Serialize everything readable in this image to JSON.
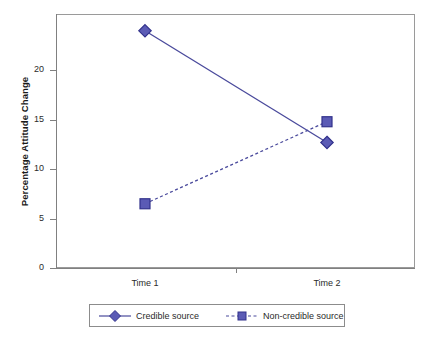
{
  "chart_data": {
    "type": "line",
    "title": "",
    "xlabel": "",
    "ylabel": "Percentage Attitude Change",
    "categories": [
      "Time 1",
      "Time 2"
    ],
    "series": [
      {
        "name": "Credible source",
        "values": [
          24.0,
          12.7
        ],
        "marker": "diamond",
        "linestyle": "solid",
        "color": "#4a4a9c"
      },
      {
        "name": "Non-credible source",
        "values": [
          6.5,
          14.8
        ],
        "marker": "square",
        "linestyle": "dashed",
        "color": "#4a4a9c"
      }
    ],
    "ylim": [
      0,
      25.7
    ],
    "yticks": [
      0,
      5,
      10,
      15,
      20
    ],
    "ytick_labels": [
      "0",
      "5",
      "10",
      "15",
      "20"
    ],
    "xtick_labels": [
      "Time 1",
      "Time 2"
    ],
    "grid": false,
    "legend_position": "bottom",
    "legend_entries": [
      "Credible source",
      "Non-credible source"
    ],
    "frame": true,
    "colors": {
      "series_line": "#4a4a9c",
      "marker_fill": "#5b5bb5",
      "marker_edge": "#33338c",
      "axis": "#808080",
      "frame": "#9a9a9a",
      "text": "#2b2b2b"
    }
  },
  "axis": {
    "y_title": "Percentage Attitude Change",
    "y_ticks": [
      {
        "label": "20"
      },
      {
        "label": "15"
      },
      {
        "label": "10"
      },
      {
        "label": "5"
      },
      {
        "label": "0"
      }
    ],
    "x_ticks": [
      {
        "label": "Time 1"
      },
      {
        "label": "Time 2"
      }
    ]
  },
  "legend": {
    "entries": [
      {
        "label": "Credible source"
      },
      {
        "label": "Non-credible source"
      }
    ]
  }
}
